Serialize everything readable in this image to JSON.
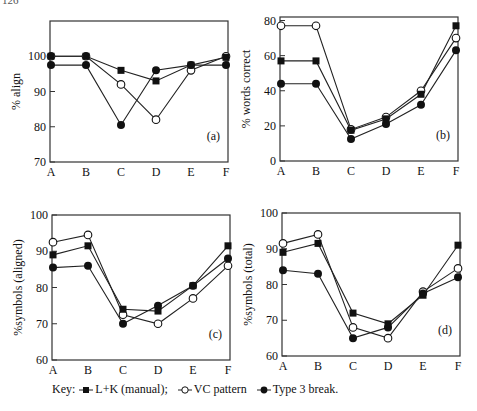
{
  "page_number": "126",
  "legend": {
    "prefix": "Key:",
    "entries": [
      {
        "label": "L+K (manual);",
        "marker": "filled-square"
      },
      {
        "label": "VC pattern",
        "marker": "open-circle"
      },
      {
        "label": "Type 3 break.",
        "marker": "filled-circle"
      }
    ]
  },
  "chart_data": [
    {
      "id": "a",
      "panel_label": "(a)",
      "type": "line",
      "title": "",
      "xlabel": "",
      "ylabel": "% align",
      "categories": [
        "A",
        "B",
        "C",
        "D",
        "E",
        "F"
      ],
      "ylim": [
        70,
        110
      ],
      "yticks": [
        70,
        80,
        90,
        100
      ],
      "grid": false,
      "series": [
        {
          "name": "L+K (manual)",
          "marker": "filled-square",
          "values": [
            100,
            100,
            96,
            93,
            97.5,
            99.7
          ]
        },
        {
          "name": "VC pattern",
          "marker": "open-circle",
          "values": [
            100,
            100,
            92,
            82,
            96,
            100
          ]
        },
        {
          "name": "Type 3 break",
          "marker": "filled-circle",
          "values": [
            97.5,
            97.5,
            80.5,
            96,
            97.5,
            97.5
          ]
        }
      ]
    },
    {
      "id": "b",
      "panel_label": "(b)",
      "type": "line",
      "title": "",
      "xlabel": "",
      "ylabel": "% words correct",
      "categories": [
        "A",
        "B",
        "C",
        "D",
        "E",
        "F"
      ],
      "ylim": [
        0,
        82
      ],
      "yticks": [
        0,
        20,
        40,
        60,
        80
      ],
      "grid": false,
      "series": [
        {
          "name": "L+K (manual)",
          "marker": "filled-square",
          "values": [
            57,
            57,
            17.5,
            24,
            38,
            77
          ]
        },
        {
          "name": "VC pattern",
          "marker": "open-circle",
          "values": [
            77,
            77,
            18,
            25,
            40,
            70
          ]
        },
        {
          "name": "Type 3 break",
          "marker": "filled-circle",
          "values": [
            44,
            44,
            12.5,
            21,
            32,
            63
          ]
        }
      ]
    },
    {
      "id": "c",
      "panel_label": "(c)",
      "type": "line",
      "title": "",
      "xlabel": "",
      "ylabel": "%symbols (aligned)",
      "categories": [
        "A",
        "B",
        "C",
        "D",
        "E",
        "F"
      ],
      "ylim": [
        60,
        100
      ],
      "yticks": [
        60,
        70,
        80,
        90,
        100
      ],
      "grid": false,
      "series": [
        {
          "name": "L+K (manual)",
          "marker": "filled-square",
          "values": [
            89,
            91.5,
            74,
            73.5,
            80.5,
            91.5
          ]
        },
        {
          "name": "VC pattern",
          "marker": "open-circle",
          "values": [
            92.5,
            94.5,
            72.5,
            70,
            77,
            86
          ]
        },
        {
          "name": "Type 3 break",
          "marker": "filled-circle",
          "values": [
            85.5,
            86,
            70,
            75,
            80.5,
            88
          ]
        }
      ]
    },
    {
      "id": "d",
      "panel_label": "(d)",
      "type": "line",
      "title": "",
      "xlabel": "",
      "ylabel": "%symbols (total)",
      "categories": [
        "A",
        "B",
        "C",
        "D",
        "E",
        "F"
      ],
      "ylim": [
        60,
        100
      ],
      "yticks": [
        60,
        70,
        80,
        90,
        100
      ],
      "grid": false,
      "series": [
        {
          "name": "L+K (manual)",
          "marker": "filled-square",
          "values": [
            89,
            91.5,
            72,
            69,
            77,
            91
          ]
        },
        {
          "name": "VC pattern",
          "marker": "open-circle",
          "values": [
            91.5,
            94,
            68,
            65,
            78,
            84.5
          ]
        },
        {
          "name": "Type 3 break",
          "marker": "filled-circle",
          "values": [
            84,
            83,
            65,
            68,
            77.5,
            82
          ]
        }
      ]
    }
  ],
  "layout": {
    "frames": {
      "a": {
        "x0": 50,
        "y0": 21,
        "x1": 228,
        "y1": 162,
        "xfirst": 51,
        "xlast": 226
      },
      "b": {
        "x0": 280,
        "y0": 17,
        "x1": 458,
        "y1": 161,
        "xfirst": 281,
        "xlast": 456
      },
      "c": {
        "x0": 52,
        "y0": 215,
        "x1": 230,
        "y1": 360,
        "xfirst": 53,
        "xlast": 228
      },
      "d": {
        "x0": 282,
        "y0": 213,
        "x1": 460,
        "y1": 356,
        "xfirst": 283,
        "xlast": 458
      }
    },
    "line_color": "#222222",
    "marker_color": "#111111"
  }
}
